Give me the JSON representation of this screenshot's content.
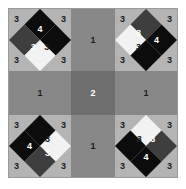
{
  "figure": {
    "colors": {
      "background": "#ffffff",
      "border": "#9a9a9a",
      "corner_cell": "#b4b4b4",
      "arm_cell": "#878787",
      "center_cell": "#6e6e6e",
      "black": "#0c0c0c",
      "dark_gray": "#3e3e3e",
      "white": "#f2f2f2",
      "label_dark": "#1c1c1c",
      "label_light": "#ffffff"
    },
    "grid": {
      "columns": 3,
      "rows": 3
    },
    "cells": {
      "top_left": {
        "corner_labels": [
          "3",
          "3",
          "3",
          "3"
        ],
        "diamond": {
          "quadrants": {
            "top_left": "black",
            "top_right": "black",
            "bottom_left": "dark",
            "bottom_right": "white"
          },
          "labels": {
            "black": "4",
            "dark": "3",
            "white": "3"
          }
        }
      },
      "top_right": {
        "corner_labels": [
          "3",
          "3",
          "3",
          "3"
        ],
        "diamond": {
          "quadrants": {
            "top_left": "dark",
            "top_right": "black",
            "bottom_left": "white",
            "bottom_right": "black"
          },
          "labels": {
            "black": "4",
            "dark": "3",
            "white": "3"
          }
        }
      },
      "bottom_left": {
        "corner_labels": [
          "3",
          "3",
          "3",
          "3"
        ],
        "diamond": {
          "quadrants": {
            "top_left": "black",
            "top_right": "white",
            "bottom_left": "black",
            "bottom_right": "dark"
          },
          "labels": {
            "black": "4",
            "dark": "3",
            "white": "3"
          }
        }
      },
      "bottom_right": {
        "corner_labels": [
          "3",
          "3",
          "3",
          "3"
        ],
        "diamond": {
          "quadrants": {
            "top_left": "white",
            "top_right": "dark",
            "bottom_left": "black",
            "bottom_right": "black"
          },
          "labels": {
            "black": "4",
            "dark": "3",
            "white": "3"
          }
        }
      },
      "top_arm": {
        "label": "1"
      },
      "left_arm": {
        "label": "1"
      },
      "right_arm": {
        "label": "1"
      },
      "bottom_arm": {
        "label": "1"
      },
      "center": {
        "label": "2"
      }
    }
  }
}
